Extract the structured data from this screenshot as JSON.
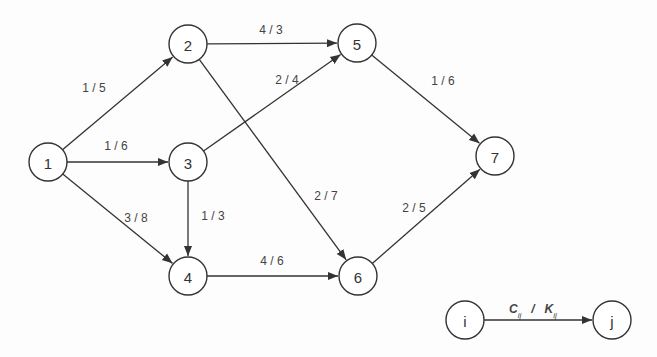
{
  "diagram": {
    "type": "directed-network-graph",
    "nodes": [
      {
        "id": "1",
        "label": "1",
        "x": 48,
        "y": 162
      },
      {
        "id": "2",
        "label": "2",
        "x": 188,
        "y": 44
      },
      {
        "id": "3",
        "label": "3",
        "x": 188,
        "y": 162
      },
      {
        "id": "4",
        "label": "4",
        "x": 188,
        "y": 276
      },
      {
        "id": "5",
        "label": "5",
        "x": 357,
        "y": 43
      },
      {
        "id": "6",
        "label": "6",
        "x": 358,
        "y": 276
      },
      {
        "id": "7",
        "label": "7",
        "x": 495,
        "y": 156
      }
    ],
    "edges": [
      {
        "from": "1",
        "to": "2",
        "label": "1 / 5",
        "lx": 94,
        "ly": 92
      },
      {
        "from": "1",
        "to": "3",
        "label": "1 / 6",
        "lx": 116,
        "ly": 150
      },
      {
        "from": "1",
        "to": "4",
        "label": "3 / 8",
        "lx": 136,
        "ly": 222
      },
      {
        "from": "2",
        "to": "5",
        "label": "4 / 3",
        "lx": 271,
        "ly": 34
      },
      {
        "from": "2",
        "to": "6",
        "label": "2 / 7",
        "lx": 326,
        "ly": 200
      },
      {
        "from": "3",
        "to": "5",
        "label": "2 / 4",
        "lx": 287,
        "ly": 84
      },
      {
        "from": "3",
        "to": "4",
        "label": "1 / 3",
        "lx": 213,
        "ly": 220
      },
      {
        "from": "4",
        "to": "6",
        "label": "4 / 6",
        "lx": 272,
        "ly": 265
      },
      {
        "from": "5",
        "to": "7",
        "label": "1 / 6",
        "lx": 443,
        "ly": 85
      },
      {
        "from": "6",
        "to": "7",
        "label": "2 / 5",
        "lx": 414,
        "ly": 212
      }
    ],
    "legend": {
      "from_node": {
        "label": "i",
        "x": 465,
        "y": 320
      },
      "to_node": {
        "label": "j",
        "x": 612,
        "y": 320
      },
      "edge_label": {
        "c": "C",
        "c_sub": "ij",
        "sep": "/",
        "k": "K",
        "k_sub": "ij"
      }
    },
    "colors": {
      "stroke": "#333333",
      "text": "#444444",
      "background": "#fdfdfd"
    }
  }
}
